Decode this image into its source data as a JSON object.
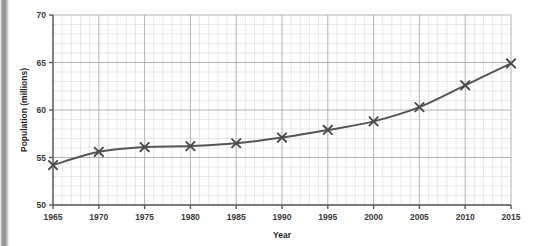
{
  "chart_data": {
    "type": "line",
    "title": "",
    "subtitle": "",
    "xlabel": "Year",
    "ylabel": "Population (millions)",
    "x": [
      1965,
      1970,
      1975,
      1980,
      1985,
      1990,
      1995,
      2000,
      2005,
      2010,
      2015
    ],
    "values": [
      54.2,
      55.6,
      56.1,
      56.2,
      56.5,
      57.1,
      57.9,
      58.8,
      60.3,
      62.6,
      64.9
    ],
    "series": [
      {
        "name": "Population",
        "values": [
          54.2,
          55.6,
          56.1,
          56.2,
          56.5,
          57.1,
          57.9,
          58.8,
          60.3,
          62.6,
          64.9
        ]
      }
    ],
    "xlim": [
      1965,
      2015
    ],
    "ylim": [
      50,
      70
    ],
    "x_tick_labels": [
      "1965",
      "1970",
      "1975",
      "1980",
      "1985",
      "1990",
      "1995",
      "2000",
      "2005",
      "2010",
      "2015"
    ],
    "y_tick_labels": [
      "50",
      "55",
      "60",
      "65",
      "70"
    ],
    "y_ticks": [
      50,
      55,
      60,
      65,
      70
    ],
    "x_major_step": 5,
    "x_minor_step": 1,
    "y_major_step": 5,
    "y_minor_step": 1,
    "grid": true,
    "grid_minor": true,
    "legend": null,
    "marker": "x-cross",
    "line_color": "#555555",
    "marker_color": "#4a4a4a",
    "grid_major_color": "#aaaaaa",
    "grid_minor_color": "#d8d8d8",
    "axis_color": "#5a5a5a",
    "background_color": "#ffffff"
  },
  "figure": {
    "x_axis_title": "Year",
    "y_axis_title": "Population (millions)"
  }
}
